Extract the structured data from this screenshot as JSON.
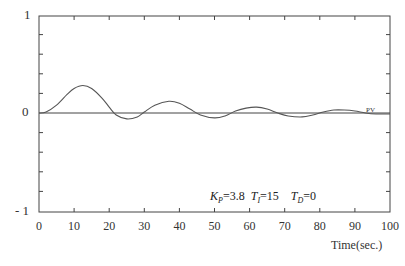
{
  "chart_data": {
    "type": "line",
    "title": "",
    "xlabel": "Time(sec.)",
    "ylabel": "",
    "xlim": [
      0,
      100
    ],
    "ylim": [
      -1,
      1
    ],
    "x_ticks": [
      "0",
      "10",
      "20",
      "30",
      "40",
      "50",
      "60",
      "70",
      "80",
      "90",
      "100"
    ],
    "y_ticks": [
      "1",
      "0",
      "- 1"
    ],
    "grid": false,
    "series": [
      {
        "name": "PV",
        "x": [
          0,
          2,
          5,
          8,
          10,
          12.5,
          15,
          18,
          20,
          22,
          25,
          28,
          30,
          33,
          37,
          40,
          43,
          46,
          50,
          53,
          56,
          59,
          62,
          65,
          68,
          71,
          75,
          78,
          81,
          84,
          87,
          90,
          93,
          96,
          100
        ],
        "y": [
          0,
          0.01,
          0.08,
          0.19,
          0.25,
          0.28,
          0.25,
          0.15,
          0.06,
          -0.02,
          -0.06,
          -0.04,
          0.01,
          0.08,
          0.12,
          0.1,
          0.04,
          -0.02,
          -0.05,
          -0.03,
          0.02,
          0.05,
          0.06,
          0.04,
          0.0,
          -0.03,
          -0.04,
          -0.02,
          0.01,
          0.03,
          0.03,
          0.02,
          0.0,
          -0.01,
          -0.01
        ]
      },
      {
        "name": "setpoint",
        "x": [
          0,
          100
        ],
        "y": [
          0,
          0
        ]
      }
    ],
    "annotations": [
      {
        "text": "PV",
        "x": 96,
        "y": 0.01
      },
      {
        "text": "K_P=3.8  T_I=15  T_D=0",
        "x": 55,
        "y": -0.78
      }
    ]
  },
  "labels": {
    "y_top": "1",
    "y_mid": "0",
    "y_bottom": "- 1",
    "xlabel": "Time(sec.)",
    "pv": "PV",
    "kp_sym": "K",
    "kp_sub": "P",
    "kp_val": "=3.8",
    "ti_sym": "T",
    "ti_sub": "I",
    "ti_val": "=15",
    "td_sym": "T",
    "td_sub": "D",
    "td_val": "=0"
  },
  "x_ticks": [
    "0",
    "10",
    "20",
    "30",
    "40",
    "50",
    "60",
    "70",
    "80",
    "90",
    "100"
  ]
}
